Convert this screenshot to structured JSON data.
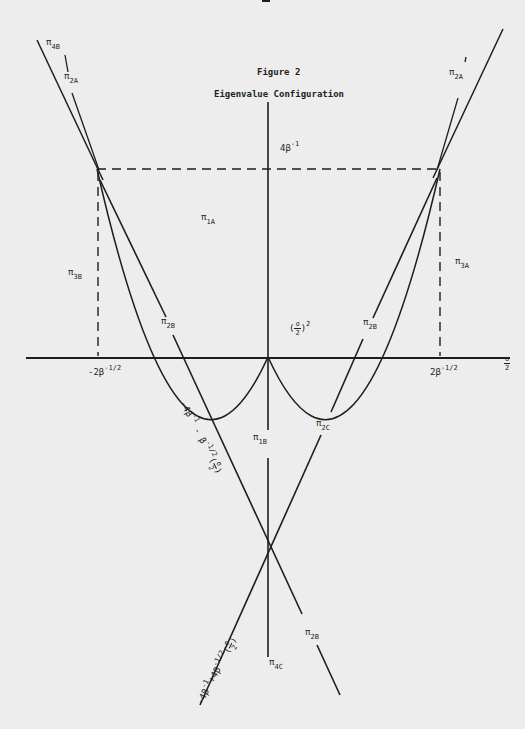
{
  "page": {
    "page_number": "11"
  },
  "figure": {
    "title": "Figure 2",
    "subtitle": "Eigenvalue Configuration"
  },
  "axes": {
    "x_label_num": "σ",
    "x_label_den": "2",
    "x_tick_left_base": "-2β",
    "x_tick_left_exp": "-1/2",
    "x_tick_right_base": "2β",
    "x_tick_right_exp": "-1/2",
    "y_tick_base": "4β",
    "y_tick_exp": "-1"
  },
  "curve": {
    "label_open": "(",
    "label_num": "σ",
    "label_den": "2",
    "label_close": ")",
    "label_exp": "2"
  },
  "region_labels": {
    "pi4B": {
      "sym": "π",
      "sub": "4B"
    },
    "pi2A_left": {
      "sym": "π",
      "sub": "2A"
    },
    "pi2A_right": {
      "sym": "π",
      "sub": "2A"
    },
    "pi1A": {
      "sym": "π",
      "sub": "1A"
    },
    "pi3B": {
      "sym": "π",
      "sub": "3B"
    },
    "pi3A": {
      "sym": "π",
      "sub": "3A"
    },
    "pi2B_left": {
      "sym": "π",
      "sub": "2B"
    },
    "pi2B_right": {
      "sym": "π",
      "sub": "2B"
    },
    "pi1B": {
      "sym": "π",
      "sub": "1B"
    },
    "pi2C": {
      "sym": "π",
      "sub": "2C"
    },
    "pi2B_bottom": {
      "sym": "π",
      "sub": "2B"
    },
    "pi4C": {
      "sym": "π",
      "sub": "4C"
    }
  },
  "line_labels": {
    "descending": {
      "text": "-4β",
      "exp1": "-1",
      "mid": " - β",
      "exp2": "-1/2",
      "frac_num": "σ",
      "frac_den": "2"
    },
    "ascending": {
      "text": "-4β",
      "exp1": "-1",
      "mid": "+4β",
      "exp2": "-1/2",
      "frac_num": "σ",
      "frac_den": "2"
    }
  },
  "colors": {
    "paper": "#ededed",
    "ink": "#1e1e1e"
  }
}
